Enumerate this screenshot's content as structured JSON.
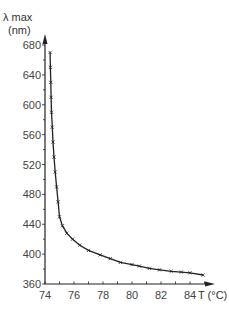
{
  "chart_data": {
    "type": "line",
    "title": "",
    "xlabel": "T (°C)",
    "ylabel": "λ max (nm)",
    "ylabel_line1": "λ max",
    "ylabel_line2": "(nm)",
    "xlim": [
      74,
      85
    ],
    "ylim": [
      360,
      690
    ],
    "x_ticks": [
      74,
      76,
      78,
      80,
      82,
      84
    ],
    "y_ticks": [
      360,
      400,
      440,
      480,
      520,
      560,
      600,
      640,
      680
    ],
    "grid": false,
    "legend": null,
    "series": [
      {
        "name": "λmax vs T",
        "marker": "x",
        "x": [
          74.35,
          74.37,
          74.4,
          74.42,
          74.45,
          74.5,
          74.55,
          74.62,
          74.7,
          74.8,
          74.9,
          75.0,
          75.2,
          75.5,
          75.9,
          76.4,
          77.0,
          77.8,
          78.5,
          79.2,
          80.0,
          80.5,
          81.2,
          81.9,
          82.7,
          83.4,
          84.0,
          84.9
        ],
        "y": [
          670,
          650,
          630,
          610,
          590,
          570,
          550,
          530,
          510,
          490,
          470,
          450,
          438,
          428,
          420,
          412,
          405,
          399,
          394,
          389,
          386,
          384,
          381,
          379,
          377,
          376,
          375,
          372
        ]
      }
    ]
  },
  "axis_labels": {
    "y_line1": "λ max",
    "y_line2": "(nm)",
    "x": "T (°C)"
  },
  "colors": {
    "line": "#222222",
    "axis": "#222222",
    "text": "#444444"
  }
}
